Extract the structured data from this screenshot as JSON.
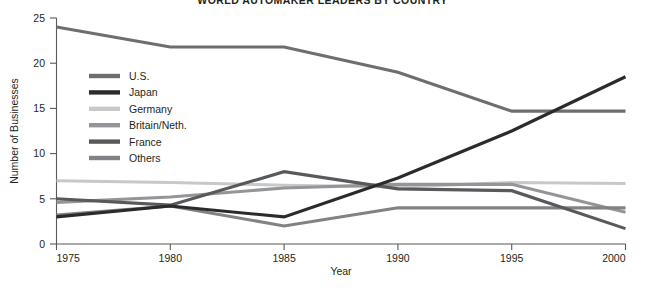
{
  "chart_data": {
    "type": "line",
    "title": "WORLD AUTOMAKER LEADERS BY COUNTRY",
    "xlabel": "Year",
    "ylabel": "Number of Businesses",
    "x": [
      1975,
      1980,
      1985,
      1990,
      1995,
      2000
    ],
    "xtick_labels": [
      "1975",
      "1980",
      "1985",
      "1990",
      "1995",
      "2000"
    ],
    "ytick_labels": [
      "0",
      "5",
      "10",
      "15",
      "20",
      "25"
    ],
    "yticks": [
      0,
      5,
      10,
      15,
      20,
      25
    ],
    "xlim": [
      1975,
      2000
    ],
    "ylim": [
      0,
      25
    ],
    "grid": false,
    "legend_position": "upper-left-inside",
    "series": [
      {
        "name": "U.S.",
        "color": "#6d6e71",
        "values": [
          24.0,
          21.8,
          21.8,
          19.0,
          14.7,
          14.7
        ]
      },
      {
        "name": "Japan",
        "color": "#2b2b2b",
        "values": [
          3.0,
          4.2,
          3.0,
          7.3,
          12.5,
          18.5
        ]
      },
      {
        "name": "Germany",
        "color": "#c7c8ca",
        "values": [
          7.0,
          6.8,
          6.5,
          6.3,
          6.8,
          6.7
        ]
      },
      {
        "name": "Britain/Neth.",
        "color": "#939598",
        "values": [
          4.6,
          5.2,
          6.2,
          6.6,
          6.6,
          3.5
        ]
      },
      {
        "name": "France",
        "color": "#58595b",
        "values": [
          5.0,
          4.3,
          8.0,
          6.1,
          5.9,
          1.7
        ]
      },
      {
        "name": "Others",
        "color": "#808285",
        "values": [
          3.2,
          4.2,
          2.0,
          4.0,
          4.0,
          4.0
        ]
      }
    ]
  },
  "legend": {
    "items": [
      {
        "label": "U.S."
      },
      {
        "label": "Japan"
      },
      {
        "label": "Germany"
      },
      {
        "label": "Britain/Neth."
      },
      {
        "label": "France"
      },
      {
        "label": "Others"
      }
    ]
  }
}
